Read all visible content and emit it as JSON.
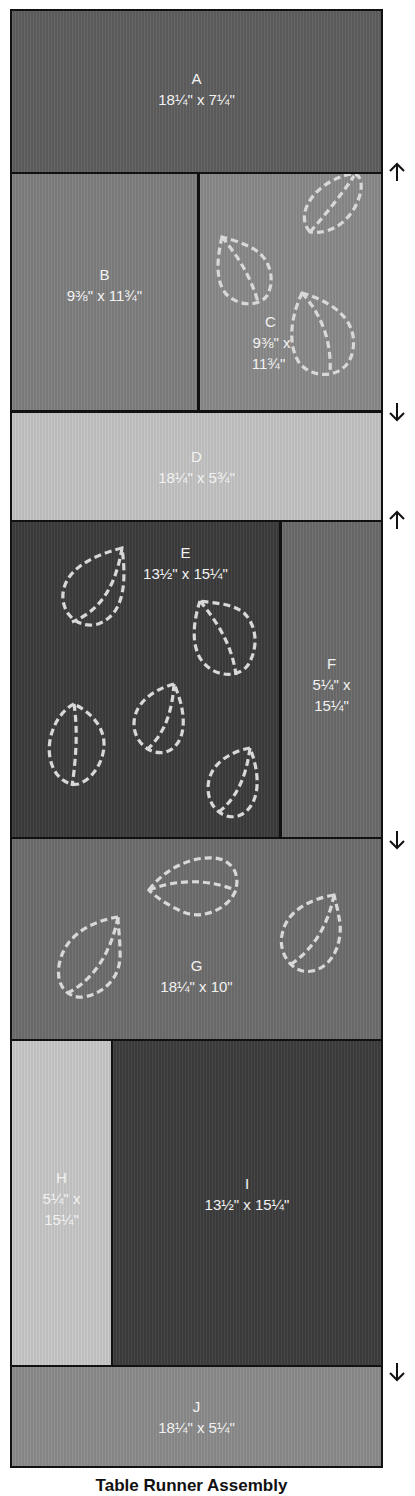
{
  "title": "Table Runner Assembly",
  "colors": {
    "border": "#111111",
    "label_text": "#f2f2f2",
    "quilting_line": "#d8d8d8",
    "background": "#ffffff"
  },
  "pieces": {
    "A": {
      "letter": "A",
      "dims": "18¼\" x 7¼\"",
      "color": "#5f5f5f"
    },
    "B": {
      "letter": "B",
      "dims": "9⅜\" x 11¾\"",
      "color": "#7f7f7f"
    },
    "C": {
      "letter": "C",
      "dims_line1": "9⅜\" x",
      "dims_line2": "11¾\"",
      "color": "#8a8a8a"
    },
    "D": {
      "letter": "D",
      "dims": "18¼\" x 5¾\"",
      "color": "#c4c4c4"
    },
    "E": {
      "letter": "E",
      "dims": "13½\" x 15¼\"",
      "color": "#3c3c3c"
    },
    "F": {
      "letter": "F",
      "dims_line1": "5¼\" x",
      "dims_line2": "15¼\"",
      "color": "#6b6b6b"
    },
    "G": {
      "letter": "G",
      "dims": "18¼\" x 10\"",
      "color": "#6e6e6e"
    },
    "H": {
      "letter": "H",
      "dims_line1": "5¼\" x",
      "dims_line2": "15¼\"",
      "color": "#c8c8c8"
    },
    "I": {
      "letter": "I",
      "dims": "13½\" x 15¼\"",
      "color": "#3d3d3d"
    },
    "J": {
      "letter": "J",
      "dims": "18¼\" x 5¼\"",
      "color": "#8c8c8c"
    }
  },
  "pressing_arrows": [
    {
      "direction": "up",
      "icon": "arrow-up-icon",
      "between": "A/B-C"
    },
    {
      "direction": "down",
      "icon": "arrow-down-icon",
      "between": "B-C/D"
    },
    {
      "direction": "up",
      "icon": "arrow-up-icon",
      "between": "D/E-F"
    },
    {
      "direction": "down",
      "icon": "arrow-down-icon",
      "between": "E-F/G"
    },
    {
      "direction": "down",
      "icon": "arrow-down-icon",
      "between": "H-I/J"
    }
  ],
  "leaf_appliques": {
    "C": 3,
    "E": 5,
    "G": 3
  }
}
